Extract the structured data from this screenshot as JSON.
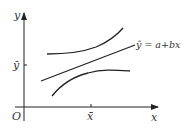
{
  "diagram": {
    "type": "regression-confidence-band",
    "axes": {
      "x_label": "x",
      "y_label": "y",
      "origin_label": "O",
      "x_mean_label": "x̄",
      "y_mean_label": "ȳ"
    },
    "regression_line": {
      "label": "ŷ = a+bx"
    },
    "curves": [
      {
        "name": "upper-confidence-bound"
      },
      {
        "name": "regression-line"
      },
      {
        "name": "lower-confidence-bound"
      }
    ],
    "colors": {
      "stroke": "#222222",
      "background": "#ffffff"
    }
  }
}
